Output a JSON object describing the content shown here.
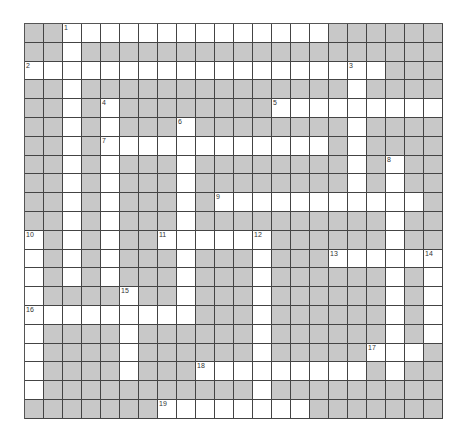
{
  "puzzle": {
    "cols": 22,
    "rows": 21,
    "colors": {
      "block": "#c8c8c8",
      "open": "#ffffff",
      "line": "#444444"
    },
    "grid": [
      "..##############......",
      "..#...................",
      "###################...",
      "..#..............#....",
      "..#.#........#########",
      "..#.#...#........#....",
      "..#.############.#....",
      "..#.#...#........#.#..",
      "..#.#...#........#.#..",
      "..#.#...#.###########.",
      "..#.#...#..........#..",
      "#.#.#..######......#..",
      "#.#.#...#...#...######",
      "#.#.#...#...#......#.#",
      "#....#..#...#......#.#",
      "#########...#......#.#",
      "#....#......#......#.#",
      "#....#......#.....###.",
      "#....#...#########.#..",
      "#...........#.........",
      ".......########......."
    ],
    "numbers": [
      {
        "n": "1",
        "r": 0,
        "c": 2
      },
      {
        "n": "2",
        "r": 2,
        "c": 0
      },
      {
        "n": "3",
        "r": 2,
        "c": 17
      },
      {
        "n": "4",
        "r": 4,
        "c": 4
      },
      {
        "n": "5",
        "r": 4,
        "c": 13
      },
      {
        "n": "6",
        "r": 5,
        "c": 8
      },
      {
        "n": "7",
        "r": 6,
        "c": 4
      },
      {
        "n": "8",
        "r": 7,
        "c": 19
      },
      {
        "n": "9",
        "r": 9,
        "c": 10
      },
      {
        "n": "10",
        "r": 11,
        "c": 0
      },
      {
        "n": "11",
        "r": 11,
        "c": 7
      },
      {
        "n": "12",
        "r": 11,
        "c": 12
      },
      {
        "n": "13",
        "r": 12,
        "c": 16
      },
      {
        "n": "14",
        "r": 12,
        "c": 21
      },
      {
        "n": "15",
        "r": 14,
        "c": 5
      },
      {
        "n": "16",
        "r": 15,
        "c": 0
      },
      {
        "n": "17",
        "r": 17,
        "c": 18
      },
      {
        "n": "18",
        "r": 18,
        "c": 9
      },
      {
        "n": "19",
        "r": 20,
        "c": 7
      }
    ]
  }
}
